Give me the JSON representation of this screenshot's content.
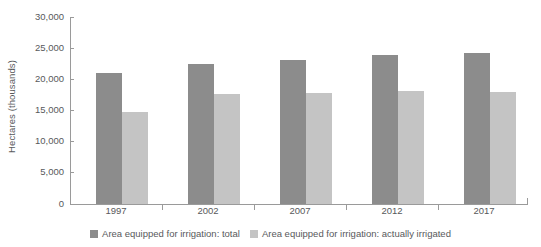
{
  "chart_data": {
    "type": "bar",
    "title": "",
    "xlabel": "",
    "ylabel": "Hectares (thousands)",
    "categories": [
      "1997",
      "2002",
      "2007",
      "2012",
      "2017"
    ],
    "series": [
      {
        "name": "Area equipped for irrigation: total",
        "color": "#8c8c8c",
        "values": [
          21000,
          22400,
          23100,
          23900,
          24200
        ]
      },
      {
        "name": "Area equipped for irrigation: actually irrigated",
        "color": "#c4c4c4",
        "values": [
          14800,
          17600,
          17800,
          18100,
          18000
        ]
      }
    ],
    "ylim": [
      0,
      30000
    ],
    "yticks": [
      0,
      5000,
      10000,
      15000,
      20000,
      25000,
      30000
    ],
    "ytick_labels": [
      "0",
      "5,000",
      "10,000",
      "15,000",
      "20,000",
      "25,000",
      "30,000"
    ],
    "grid": false,
    "legend_position": "bottom"
  }
}
